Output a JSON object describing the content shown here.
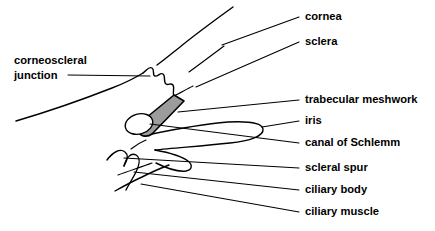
{
  "figure": {
    "background_color": "#ffffff",
    "line_color": "#000000",
    "meshwork_fill_color": "#9c9c9c"
  },
  "labels": {
    "left": [
      {
        "id": "corneoscleral-junction",
        "line1": "corneoscleral",
        "line2": "junction"
      }
    ],
    "right": [
      {
        "id": "cornea",
        "text": "cornea"
      },
      {
        "id": "sclera",
        "text": "sclera"
      },
      {
        "id": "trabecular-meshwork",
        "text": "trabecular meshwork"
      },
      {
        "id": "iris",
        "text": "iris"
      },
      {
        "id": "canal-of-schlemm",
        "text": "canal of Schlemm"
      },
      {
        "id": "scleral-spur",
        "text": "scleral spur"
      },
      {
        "id": "ciliary-body",
        "text": "ciliary body"
      },
      {
        "id": "ciliary-muscle",
        "text": "ciliary muscle"
      }
    ]
  }
}
